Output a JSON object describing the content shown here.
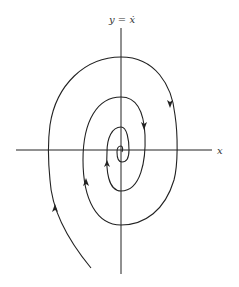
{
  "diagram": {
    "type": "phase-portrait",
    "axes": {
      "x_label": "x",
      "y_label": "y = ẋ"
    },
    "colors": {
      "line": "#222222",
      "background": "#ffffff"
    },
    "trajectory": {
      "direction": "clockwise, inward",
      "arrow_count": 5
    }
  }
}
